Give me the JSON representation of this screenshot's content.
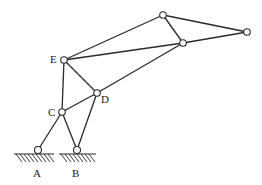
{
  "diagram": {
    "type": "planar linkage mechanism",
    "labels": {
      "A": "A",
      "B": "B",
      "C": "C",
      "D": "D",
      "E": "E"
    },
    "joints": [
      {
        "id": "A",
        "x": 38,
        "y": 150,
        "ground": true
      },
      {
        "id": "B",
        "x": 77,
        "y": 150,
        "ground": true
      },
      {
        "id": "C",
        "x": 62,
        "y": 112
      },
      {
        "id": "D",
        "x": 97,
        "y": 93
      },
      {
        "id": "E",
        "x": 64,
        "y": 60
      },
      {
        "id": "P1",
        "x": 163,
        "y": 15
      },
      {
        "id": "P2",
        "x": 183,
        "y": 43
      },
      {
        "id": "P3",
        "x": 247,
        "y": 32
      }
    ],
    "links": [
      [
        "A",
        "C"
      ],
      [
        "B",
        "C"
      ],
      [
        "B",
        "D"
      ],
      [
        "C",
        "D"
      ],
      [
        "C",
        "E"
      ],
      [
        "E",
        "D"
      ],
      [
        "E",
        "P1"
      ],
      [
        "E",
        "P2"
      ],
      [
        "D",
        "P2"
      ],
      [
        "P1",
        "P2"
      ],
      [
        "P1",
        "P3"
      ],
      [
        "P2",
        "P3"
      ]
    ]
  }
}
